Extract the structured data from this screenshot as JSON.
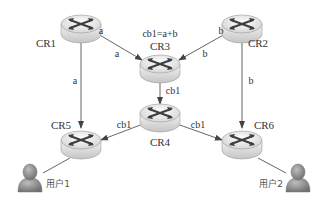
{
  "diagram": {
    "type": "network-coding-topology",
    "colors": {
      "line": "#555555",
      "text": "#333333",
      "router_top": "#e8e8e8",
      "router_side": "#d0d0d0",
      "router_arrows": "#4a4a4a",
      "user": "#8a8a8a"
    },
    "nodes": [
      {
        "id": "CR1",
        "label": "CR1",
        "kind": "router-icon",
        "x": 81,
        "y": 28,
        "label_x": 46,
        "label_y": 47
      },
      {
        "id": "CR2",
        "label": "CR2",
        "kind": "router-icon",
        "x": 242,
        "y": 28,
        "label_x": 256,
        "label_y": 47
      },
      {
        "id": "CR3",
        "label": "CR3",
        "kind": "router-icon",
        "x": 160,
        "y": 66,
        "label_x": 160,
        "label_y": 49
      },
      {
        "id": "CR4",
        "label": "CR4",
        "kind": "router-icon",
        "x": 160,
        "y": 117,
        "label_x": 160,
        "label_y": 146
      },
      {
        "id": "CR5",
        "label": "CR5",
        "kind": "router-icon",
        "x": 81,
        "y": 143,
        "label_x": 60,
        "label_y": 128
      },
      {
        "id": "CR6",
        "label": "CR6",
        "kind": "router-icon",
        "x": 242,
        "y": 143,
        "label_x": 264,
        "label_y": 128
      }
    ],
    "users": [
      {
        "id": "user1",
        "label": "用户1",
        "x": 31,
        "y": 178,
        "label_x": 57,
        "label_y": 186
      },
      {
        "id": "user2",
        "label": "用户2",
        "x": 297,
        "y": 178,
        "label_x": 270,
        "label_y": 186
      }
    ],
    "annotation": {
      "text": "cb1=a+b",
      "x": 160,
      "y": 37
    },
    "edges": [
      {
        "from": "CR1",
        "to": "CR3",
        "label": "a",
        "label_x": 117,
        "label_y": 55,
        "arrow": true
      },
      {
        "from": "CR1",
        "to": "CR5",
        "label": "a",
        "label_x": 75,
        "label_y": 83,
        "arrow": true
      },
      {
        "from": "CR2",
        "to": "CR3",
        "label": "b",
        "label_x": 205,
        "label_y": 55,
        "arrow": true
      },
      {
        "from": "CR2",
        "to": "CR6",
        "label": "b",
        "label_x": 251,
        "label_y": 83,
        "arrow": true
      },
      {
        "from": "CR3",
        "to": "CR4",
        "label": "cb1",
        "label_x": 171,
        "label_y": 94,
        "arrow": true
      },
      {
        "from": "CR4",
        "to": "CR5",
        "label": "cb1",
        "label_x": 124,
        "label_y": 128,
        "arrow": true
      },
      {
        "from": "CR4",
        "to": "CR6",
        "label": "cb1",
        "label_x": 197,
        "label_y": 128,
        "arrow": true
      },
      {
        "from": "CR5",
        "to": "user1",
        "label": "",
        "arrow": false
      },
      {
        "from": "CR6",
        "to": "user2",
        "label": "",
        "arrow": false
      }
    ],
    "port_labels": [
      {
        "text": "a",
        "near": "CR1",
        "x": 100,
        "y": 34
      },
      {
        "text": "b",
        "near": "CR2",
        "x": 221,
        "y": 34
      }
    ]
  }
}
